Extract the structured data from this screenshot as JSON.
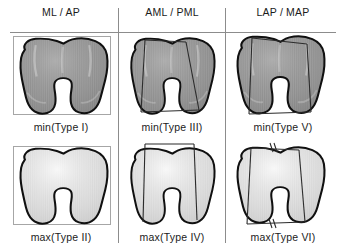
{
  "figure": {
    "title_row": {
      "columns": [
        {
          "id": "ml-ap",
          "label": "ML / AP"
        },
        {
          "id": "aml-pml",
          "label": "AML / PML"
        },
        {
          "id": "lap-map",
          "label": "LAP / MAP"
        }
      ]
    },
    "rules": {
      "header_underline": true,
      "column_dividers": 2,
      "rule_color": "#8c8c8c"
    },
    "rows": [
      {
        "id": "min-row",
        "prefix": "min",
        "fill": "#9b9b9b",
        "panels": [
          {
            "id": "type-1",
            "caption": "min(Type I)",
            "measure": "ML / AP",
            "annotation": "bounding-box",
            "shape": "femoral-condyle-outline"
          },
          {
            "id": "type-3",
            "caption": "min(Type III)",
            "measure": "AML / PML",
            "annotation": "oblique-caliper-lines",
            "shape": "femoral-condyle-outline"
          },
          {
            "id": "type-5",
            "caption": "min(Type V)",
            "measure": "LAP / MAP",
            "annotation": "oblique-caliper-lines",
            "shape": "femoral-condyle-outline"
          }
        ]
      },
      {
        "id": "max-row",
        "prefix": "max",
        "fill": "#dcdcdc",
        "panels": [
          {
            "id": "type-2",
            "caption": "max(Type II)",
            "measure": "ML / AP",
            "annotation": "bounding-box",
            "shape": "femoral-condyle-outline"
          },
          {
            "id": "type-4",
            "caption": "max(Type IV)",
            "measure": "AML / PML",
            "annotation": "bracket-and-parallel-lines",
            "shape": "femoral-condyle-outline"
          },
          {
            "id": "type-6",
            "caption": "max(Type VI)",
            "measure": "LAP / MAP",
            "annotation": "parallel-hash-marks",
            "hash_marks": "//",
            "shape": "femoral-condyle-outline"
          }
        ]
      }
    ],
    "colors": {
      "outline": "#111111",
      "annotation_line": "#2b2b2b",
      "box_line": "#9a9a9a",
      "fill_dark": "#9b9b9b",
      "fill_light": "#dcdcdc",
      "text": "#1b1b1b",
      "background": "#ffffff"
    }
  }
}
